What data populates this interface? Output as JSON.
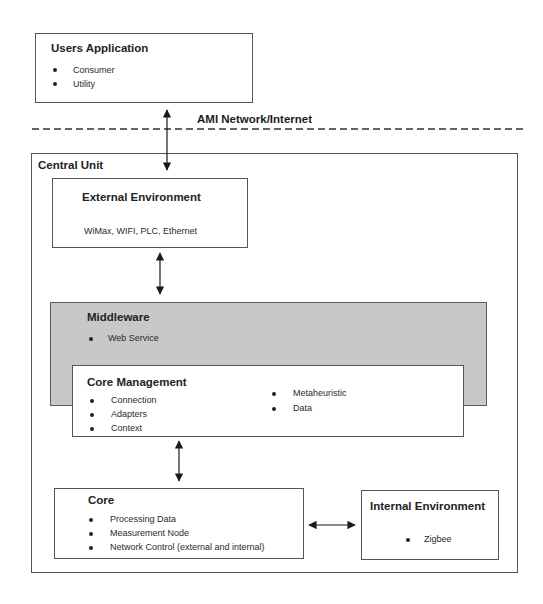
{
  "diagram": {
    "network_label": "AMI Network/Internet",
    "users_application": {
      "title": "Users Application",
      "items": [
        "Consumer",
        "Utility"
      ]
    },
    "central_unit": {
      "title": "Central Unit",
      "external_environment": {
        "title": "External Environment",
        "text": "WiMax, WIFI, PLC, Ethernet"
      },
      "middleware": {
        "title": "Middleware",
        "items": [
          "Web Service"
        ]
      },
      "core_management": {
        "title": "Core Management",
        "items_left": [
          "Connection",
          "Adapters",
          "Context"
        ],
        "items_right": [
          "Metaheuristic",
          "Data"
        ]
      },
      "core": {
        "title": "Core",
        "items": [
          "Processing Data",
          "Measurement Node",
          "Network Control (external and internal)"
        ]
      },
      "internal_environment": {
        "title": "Internal Environment",
        "items": [
          "Zigbee"
        ]
      }
    },
    "colors": {
      "middleware_fill": "#c8c8c8",
      "border": "#555555"
    }
  }
}
